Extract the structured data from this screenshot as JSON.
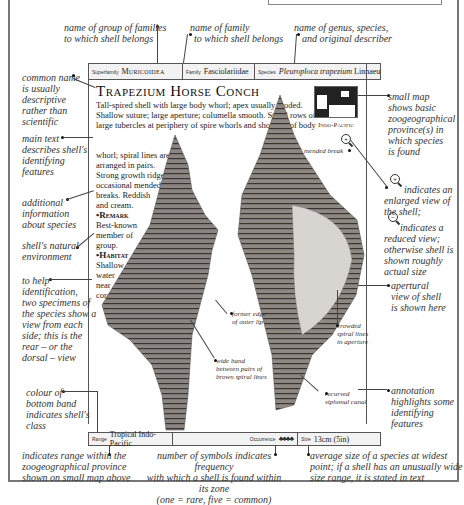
{
  "annotations": {
    "superfamily_note": [
      "name of group of families",
      "to which shell belongs"
    ],
    "family_note": [
      "name of family",
      "to which shell belongs"
    ],
    "species_note": [
      "name of genus, species,",
      "and original describer"
    ],
    "common_name_note": [
      "common name",
      "is usually",
      "descriptive",
      "rather than",
      "scientific"
    ],
    "main_text_note": [
      "main text",
      "describes shell's",
      "identifying",
      "features"
    ],
    "additional_info_note": [
      "additional",
      "information",
      "about species"
    ],
    "environment_note": [
      "shell's natural",
      "environment"
    ],
    "identification_note": [
      "to help",
      "identification,",
      "two specimens of",
      "the species show a",
      "view from each",
      "side; this is the",
      "rear – or the",
      "dorsal – view"
    ],
    "band_colour_note": [
      "colour of",
      "bottom band",
      "indicates shell's",
      "class"
    ],
    "map_note": [
      "small map",
      "shows basic",
      "zoogeographical",
      "province(s) in",
      "which species",
      "is found"
    ],
    "enlarged_note": [
      "indicates an",
      "enlarged view of",
      "the shell;"
    ],
    "reduced_note": [
      "indicates a",
      "reduced view;",
      "otherwise shell is",
      "shown roughly",
      "actual size"
    ],
    "apertural_note": [
      "apertural",
      "view of shell",
      "is shown here"
    ],
    "annotation_note": [
      "annotation",
      "highlights some",
      "identifying",
      "features"
    ],
    "range_note": [
      "indicates range within the",
      "zoogeographical province",
      "shown on small map above"
    ],
    "occurrence_note": [
      "number of symbols indicates frequency",
      "with which a shell is found within its zone",
      "(one = rare, five = common)"
    ],
    "size_note": [
      "average size of a species at widest",
      "point; if a shell has an unusually wide",
      "size range, it is stated in text"
    ],
    "shell_labels": {
      "mended_break": "mended break",
      "former_edge": [
        "former edge",
        "of outer lip"
      ],
      "wide_band": [
        "wide band",
        "between pairs of",
        "brown spiral lines"
      ],
      "crowded_lines": [
        "crowded",
        "spiral lines",
        "in aperture"
      ],
      "recurved_canal": [
        "recurved",
        "siphonal canal"
      ]
    }
  },
  "header": {
    "superfamily_label": "Superfamily",
    "superfamily_value": "Muricoidea",
    "family_label": "Family",
    "family_value": "Fasciolariidae",
    "species_label": "Species",
    "species_value": "Pleuroploca trapezium",
    "species_author": "Linnaeus"
  },
  "entry": {
    "title": "Trapezium Horse Conch",
    "description_wide": "Tall-spired shell with large body whorl; apex usually eroded. Shallow suture; large aperture; columella smooth. Spiral rows of large tubercles at periphery of spire whorls and shoulder of body",
    "description_narrow": [
      "whorl; spiral lines are",
      "arranged in pairs.",
      "Strong growth ridges;",
      "occasional mended",
      "breaks. Reddish",
      "and cream."
    ],
    "remark_heading": "Remark",
    "remark_text": [
      "Best-known",
      "member of",
      "group."
    ],
    "habitat_heading": "Habitat",
    "habitat_text": [
      "Shallow",
      "water",
      "near",
      "coral."
    ],
    "map_label": "Indo-Pacific"
  },
  "footer": {
    "range_label": "Range",
    "range_value": "Tropical Indo-Pacific",
    "occurrence_label": "Occurrence",
    "occurrence_symbols": "♣♣♣♣",
    "size_label": "Size",
    "size_value": "13cm (5in)"
  }
}
